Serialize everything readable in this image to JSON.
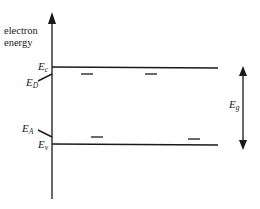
{
  "diagram": {
    "type": "semiconductor-energy-band-diagram",
    "axis": {
      "label_line1": "electron",
      "label_line2": "energy"
    },
    "levels": {
      "conduction_band": {
        "symbol": "E",
        "subscript": "c"
      },
      "donor": {
        "symbol": "E",
        "subscript": "D"
      },
      "acceptor": {
        "symbol": "E",
        "subscript": "A"
      },
      "valence_band": {
        "symbol": "E",
        "subscript": "v"
      }
    },
    "gap": {
      "symbol": "E",
      "subscript": "g"
    },
    "colors": {
      "ink": "#1a1a1a",
      "background": "#ffffff"
    }
  }
}
